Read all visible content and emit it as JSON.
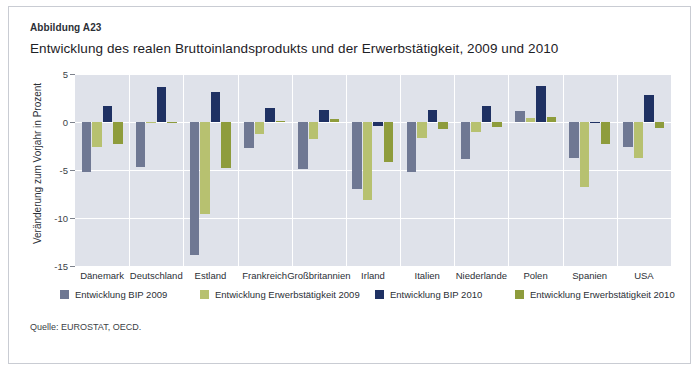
{
  "figure": {
    "label": "Abbildung A23",
    "title": "Entwicklung des realen Bruttoinlandsprodukts und der Erwerbstätigkeit, 2009 und 2010",
    "source": "Quelle: EUROSTAT, OECD."
  },
  "colors": {
    "plot_background": "#dfe2ea",
    "grid": "#ffffff",
    "bip_2009": "#6f7893",
    "erwerb_2009": "#b7c170",
    "bip_2010": "#1f3163",
    "erwerb_2010": "#8e9c3c",
    "page_background": "#ffffff",
    "frame": "#c9ccd3"
  },
  "chart_data": {
    "type": "bar",
    "title": "Entwicklung des realen Bruttoinlandsprodukts und der Erwerbstätigkeit, 2009 und 2010",
    "xlabel": "",
    "ylabel": "Veränderung zum Vorjahr in Prozent",
    "ylim": [
      -15,
      5
    ],
    "yticks": [
      5,
      0,
      -5,
      -10,
      -15
    ],
    "ytick_labels": [
      "5",
      "0",
      "-5",
      "-10",
      "-15"
    ],
    "grid": true,
    "legend_position": "bottom",
    "categories": [
      "Dänemark",
      "Deutschland",
      "Estland",
      "Frankreich",
      "Großbritannien",
      "Irland",
      "Italien",
      "Niederlande",
      "Polen",
      "Spanien",
      "USA"
    ],
    "series": [
      {
        "name": "Entwicklung BIP 2009",
        "color": "#6f7893",
        "values": [
          -5.2,
          -4.7,
          -13.9,
          -2.7,
          -4.9,
          -7.0,
          -5.2,
          -3.9,
          1.1,
          -3.7,
          -2.6
        ]
      },
      {
        "name": "Entwicklung Erwerbstätigkeit 2009",
        "color": "#b7c170",
        "values": [
          -2.6,
          0.0,
          -9.6,
          -1.2,
          -1.8,
          -8.1,
          -1.7,
          -1.0,
          0.4,
          -6.8,
          -3.8
        ]
      },
      {
        "name": "Entwicklung BIP 2010",
        "color": "#1f3163",
        "values": [
          1.7,
          3.6,
          3.1,
          1.5,
          1.3,
          -0.4,
          1.2,
          1.7,
          3.7,
          -0.1,
          2.8
        ]
      },
      {
        "name": "Entwicklung Erwerbstätigkeit 2010",
        "color": "#8e9c3c",
        "values": [
          -2.3,
          -0.1,
          -4.8,
          0.1,
          0.3,
          -4.2,
          -0.7,
          -0.5,
          0.5,
          -2.3,
          -0.6
        ]
      }
    ]
  },
  "legend": [
    {
      "label": "Entwicklung BIP 2009",
      "color": "#6f7893"
    },
    {
      "label": "Entwicklung Erwerbstätigkeit 2009",
      "color": "#b7c170"
    },
    {
      "label": "Entwicklung BIP 2010",
      "color": "#1f3163"
    },
    {
      "label": "Entwicklung Erwerbstätigkeit 2010",
      "color": "#8e9c3c"
    }
  ]
}
